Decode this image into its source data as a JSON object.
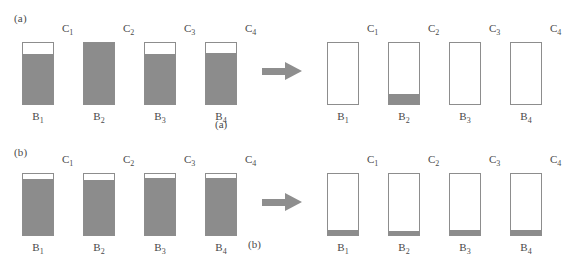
{
  "figure": {
    "colors": {
      "fill_gray": "#8c8c8c",
      "outline_gray": "#8d8d8d",
      "arrow_gray": "#8e8e8e",
      "text_gray": "#4a4a4a",
      "background": "#ffffff"
    }
  },
  "panels": [
    {
      "id": "a",
      "tag": "(a)",
      "caption": "(a)",
      "arrow": {
        "name": "transition-arrow",
        "direction": "right"
      },
      "before": {
        "columns": [
          {
            "label": "B",
            "sub": "1",
            "fill_percent": 82
          },
          {
            "label": "B",
            "sub": "2",
            "fill_percent": 100
          },
          {
            "label": "B",
            "sub": "3",
            "fill_percent": 82
          },
          {
            "label": "B",
            "sub": "4",
            "fill_percent": 84
          }
        ],
        "connectors": [
          {
            "label": "C",
            "sub": "1"
          },
          {
            "label": "C",
            "sub": "2"
          },
          {
            "label": "C",
            "sub": "3"
          },
          {
            "label": "C",
            "sub": "4"
          }
        ]
      },
      "after": {
        "columns": [
          {
            "label": "B",
            "sub": "1",
            "fill_percent": 0
          },
          {
            "label": "B",
            "sub": "2",
            "fill_percent": 17
          },
          {
            "label": "B",
            "sub": "3",
            "fill_percent": 0
          },
          {
            "label": "B",
            "sub": "4",
            "fill_percent": 0
          }
        ],
        "connectors": [
          {
            "label": "C",
            "sub": "1"
          },
          {
            "label": "C",
            "sub": "2"
          },
          {
            "label": "C",
            "sub": "3"
          },
          {
            "label": "C",
            "sub": "4"
          }
        ]
      }
    },
    {
      "id": "b",
      "tag": "(b)",
      "caption": "(b)",
      "arrow": {
        "name": "transition-arrow",
        "direction": "right"
      },
      "before": {
        "columns": [
          {
            "label": "B",
            "sub": "1",
            "fill_percent": 92
          },
          {
            "label": "B",
            "sub": "2",
            "fill_percent": 90
          },
          {
            "label": "B",
            "sub": "3",
            "fill_percent": 93
          },
          {
            "label": "B",
            "sub": "4",
            "fill_percent": 93
          }
        ],
        "connectors": [
          {
            "label": "C",
            "sub": "1"
          },
          {
            "label": "C",
            "sub": "2"
          },
          {
            "label": "C",
            "sub": "3"
          },
          {
            "label": "C",
            "sub": "4"
          }
        ]
      },
      "after": {
        "columns": [
          {
            "label": "B",
            "sub": "1",
            "fill_percent": 8
          },
          {
            "label": "B",
            "sub": "2",
            "fill_percent": 7
          },
          {
            "label": "B",
            "sub": "3",
            "fill_percent": 9
          },
          {
            "label": "B",
            "sub": "4",
            "fill_percent": 8
          }
        ],
        "connectors": [
          {
            "label": "C",
            "sub": "1"
          },
          {
            "label": "C",
            "sub": "2"
          },
          {
            "label": "C",
            "sub": "3"
          },
          {
            "label": "C",
            "sub": "4"
          }
        ]
      }
    }
  ]
}
